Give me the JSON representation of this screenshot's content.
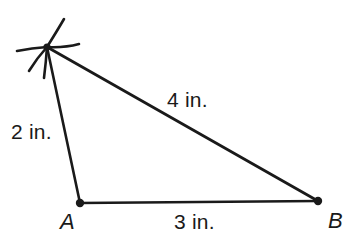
{
  "figure": {
    "type": "geometry-construction-triangle",
    "background_color": "#ffffff",
    "stroke_color": "#1a1a1a",
    "vertices": [
      {
        "id": "C",
        "name": "apex-construction-point",
        "label": "",
        "x": 47,
        "y": 47,
        "marker": "arc-intersection-star"
      },
      {
        "id": "A",
        "name": "vertex-a",
        "label": "A",
        "x": 80,
        "y": 203,
        "marker": "dot"
      },
      {
        "id": "B",
        "name": "vertex-b",
        "label": "B",
        "x": 318,
        "y": 201,
        "marker": "dot"
      }
    ],
    "sides": [
      {
        "id": "CA",
        "from": "C",
        "to": "A",
        "label": "2 in.",
        "value": 2,
        "unit": "in."
      },
      {
        "id": "CB",
        "from": "C",
        "to": "B",
        "label": "4 in.",
        "value": 4,
        "unit": "in."
      },
      {
        "id": "AB",
        "from": "A",
        "to": "B",
        "label": "3 in.",
        "value": 3,
        "unit": "in."
      }
    ],
    "construction_arcs": [
      {
        "name": "arc-up-right",
        "x1": 47,
        "y1": 47,
        "x2": 64,
        "y2": 19
      },
      {
        "name": "arc-right-horizontal",
        "x1": 47,
        "y1": 47,
        "x2": 79,
        "y2": 44
      },
      {
        "name": "arc-left-horizontal",
        "x1": 47,
        "y1": 47,
        "x2": 17,
        "y2": 51
      },
      {
        "name": "arc-down-left",
        "x1": 47,
        "y1": 47,
        "x2": 29,
        "y2": 71
      },
      {
        "name": "arc-down",
        "x1": 47,
        "y1": 47,
        "x2": 44,
        "y2": 78
      }
    ],
    "labels": {
      "side_ca": "2 in.",
      "side_cb": "4 in.",
      "side_ab": "3 in.",
      "vertex_a": "A",
      "vertex_b": "B"
    }
  }
}
